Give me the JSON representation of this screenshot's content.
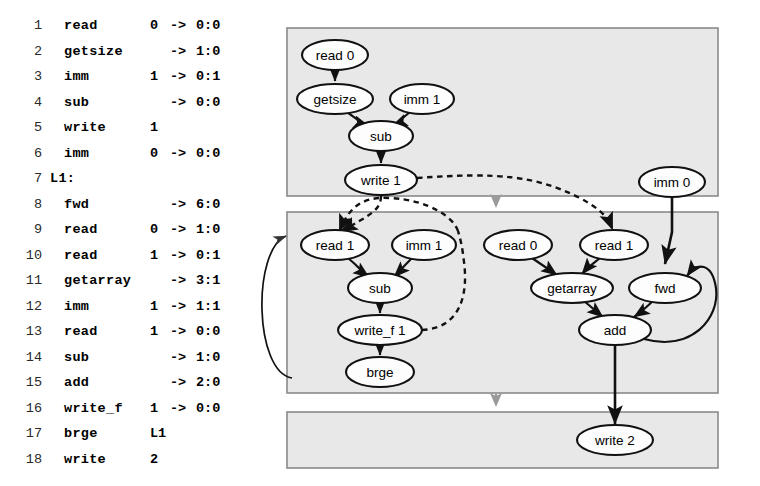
{
  "figure": {
    "kind": "compiler-ir-listing-and-dataflow-graph",
    "box_fill": "#e8e8e8",
    "box_stroke": "#8a8a8a",
    "node_fill": "#fdfdfd",
    "node_stroke": "#111111",
    "edge_color": "#111111",
    "dashed_edge_color": "#111111",
    "gray_arrow_color": "#9a9a9a"
  },
  "code_listing": {
    "lines": [
      {
        "num": "1",
        "op": "read",
        "arg": "0",
        "arrow": "->",
        "dst": "0:0"
      },
      {
        "num": "2",
        "op": "getsize",
        "arg": "",
        "arrow": "->",
        "dst": "1:0"
      },
      {
        "num": "3",
        "op": "imm",
        "arg": "1",
        "arrow": "->",
        "dst": "0:1"
      },
      {
        "num": "4",
        "op": "sub",
        "arg": "",
        "arrow": "->",
        "dst": "0:0"
      },
      {
        "num": "5",
        "op": "write",
        "arg": "1",
        "arrow": "",
        "dst": ""
      },
      {
        "num": "6",
        "op": "imm",
        "arg": "0",
        "arrow": "->",
        "dst": "0:0"
      },
      {
        "num": "7",
        "op": "L1:",
        "arg": "",
        "arrow": "",
        "dst": "",
        "is_label": true
      },
      {
        "num": "8",
        "op": "fwd",
        "arg": "",
        "arrow": "->",
        "dst": "6:0"
      },
      {
        "num": "9",
        "op": "read",
        "arg": "0",
        "arrow": "->",
        "dst": "1:0"
      },
      {
        "num": "10",
        "op": "read",
        "arg": "1",
        "arrow": "->",
        "dst": "0:1"
      },
      {
        "num": "11",
        "op": "getarray",
        "arg": "",
        "arrow": "->",
        "dst": "3:1"
      },
      {
        "num": "12",
        "op": "imm",
        "arg": "1",
        "arrow": "->",
        "dst": "1:1"
      },
      {
        "num": "13",
        "op": "read",
        "arg": "1",
        "arrow": "->",
        "dst": "0:0"
      },
      {
        "num": "14",
        "op": "sub",
        "arg": "",
        "arrow": "->",
        "dst": "1:0"
      },
      {
        "num": "15",
        "op": "add",
        "arg": "",
        "arrow": "->",
        "dst": "2:0"
      },
      {
        "num": "16",
        "op": "write_f",
        "arg": "1",
        "arrow": "->",
        "dst": "0:0"
      },
      {
        "num": "17",
        "op": "brge",
        "arg": "L1",
        "arrow": "",
        "dst": ""
      },
      {
        "num": "18",
        "op": "write",
        "arg": "2",
        "arrow": "",
        "dst": ""
      }
    ]
  },
  "graph": {
    "regions": [
      {
        "id": "region-prologue",
        "x": 37,
        "y": 28,
        "w": 431,
        "h": 168
      },
      {
        "id": "region-loop-body",
        "x": 37,
        "y": 212,
        "w": 431,
        "h": 181
      },
      {
        "id": "region-epilogue",
        "x": 37,
        "y": 412,
        "w": 431,
        "h": 56
      }
    ],
    "nodes": [
      {
        "id": "n-read0-top",
        "label": "read 0",
        "cx": 85,
        "cy": 55,
        "rx": 33,
        "ry": 15
      },
      {
        "id": "n-getsize",
        "label": "getsize",
        "cx": 85,
        "cy": 99,
        "rx": 38,
        "ry": 15
      },
      {
        "id": "n-imm1-top",
        "label": "imm 1",
        "cx": 172,
        "cy": 99,
        "rx": 32,
        "ry": 15
      },
      {
        "id": "n-sub-top",
        "label": "sub",
        "cx": 131,
        "cy": 136,
        "rx": 32,
        "ry": 15
      },
      {
        "id": "n-write1",
        "label": "write 1",
        "cx": 131,
        "cy": 180,
        "rx": 36,
        "ry": 15
      },
      {
        "id": "n-imm0",
        "label": "imm 0",
        "cx": 422,
        "cy": 182,
        "rx": 33,
        "ry": 15
      },
      {
        "id": "n-read1-a",
        "label": "read 1",
        "cx": 85,
        "cy": 245,
        "rx": 34,
        "ry": 15
      },
      {
        "id": "n-imm1-mid",
        "label": "imm 1",
        "cx": 174,
        "cy": 245,
        "rx": 32,
        "ry": 15
      },
      {
        "id": "n-read0-mid",
        "label": "read 0",
        "cx": 268,
        "cy": 245,
        "rx": 34,
        "ry": 15
      },
      {
        "id": "n-read1-b",
        "label": "read 1",
        "cx": 364,
        "cy": 245,
        "rx": 34,
        "ry": 15
      },
      {
        "id": "n-sub-mid",
        "label": "sub",
        "cx": 130,
        "cy": 288,
        "rx": 32,
        "ry": 15
      },
      {
        "id": "n-getarray",
        "label": "getarray",
        "cx": 322,
        "cy": 288,
        "rx": 41,
        "ry": 15
      },
      {
        "id": "n-fwd",
        "label": "fwd",
        "cx": 415,
        "cy": 288,
        "rx": 36,
        "ry": 15
      },
      {
        "id": "n-writef1",
        "label": "write_f 1",
        "cx": 130,
        "cy": 330,
        "rx": 42,
        "ry": 15
      },
      {
        "id": "n-add",
        "label": "add",
        "cx": 365,
        "cy": 330,
        "rx": 36,
        "ry": 15
      },
      {
        "id": "n-brge",
        "label": "brge",
        "cx": 130,
        "cy": 372,
        "rx": 34,
        "ry": 15
      },
      {
        "id": "n-write2",
        "label": "write 2",
        "cx": 365,
        "cy": 440,
        "rx": 38,
        "ry": 15
      }
    ]
  }
}
